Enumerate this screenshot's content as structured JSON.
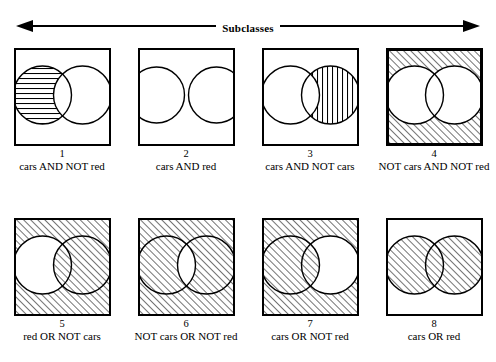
{
  "figure": {
    "header": {
      "label": "Subclasses",
      "arrow": "double-headed-horizontal-arrow"
    },
    "style": {
      "ink": "#000000",
      "paper": "#ffffff",
      "stroke_width": 1.4,
      "box_stroke_width": 2,
      "box_stroke_width_heavy": 3,
      "hatch_spacing": 5,
      "hatch_stroke_width": 1.1
    },
    "box": {
      "width": 97,
      "height": 98
    },
    "cells": [
      {
        "number": "1",
        "caption": "cars AND NOT red",
        "hatch": "horizontal",
        "regions": [
          "left-only"
        ],
        "border": "normal",
        "layout": "standard"
      },
      {
        "number": "2",
        "caption": "cars AND red",
        "hatch": "grid",
        "regions": [
          "intersection"
        ],
        "border": "normal",
        "layout": "wide"
      },
      {
        "number": "3",
        "caption": "cars AND NOT cars",
        "hatch": "vertical",
        "regions": [
          "right-only"
        ],
        "border": "normal",
        "layout": "standard"
      },
      {
        "number": "4",
        "caption": "NOT cars AND NOT red",
        "hatch": "diagonal",
        "regions": [
          "outside"
        ],
        "border": "heavy",
        "layout": "standard"
      },
      {
        "number": "5",
        "caption": "red OR NOT cars",
        "hatch": "diagonal",
        "regions": [
          "outside",
          "intersection",
          "right-only"
        ],
        "border": "normal",
        "layout": "standard"
      },
      {
        "number": "6",
        "caption": "NOT cars OR NOT red",
        "hatch": "diagonal",
        "regions": [
          "outside",
          "left-only",
          "right-only"
        ],
        "border": "normal",
        "layout": "standard"
      },
      {
        "number": "7",
        "caption": "cars OR NOT red",
        "hatch": "diagonal",
        "regions": [
          "outside",
          "left-only",
          "intersection"
        ],
        "border": "normal",
        "layout": "standard"
      },
      {
        "number": "8",
        "caption": "cars OR red",
        "hatch": "diagonal",
        "regions": [
          "left-only",
          "intersection",
          "right-only"
        ],
        "border": "normal",
        "layout": "standard"
      }
    ],
    "rows": [
      [
        0,
        1,
        2,
        3
      ],
      [
        4,
        5,
        6,
        7
      ]
    ]
  }
}
